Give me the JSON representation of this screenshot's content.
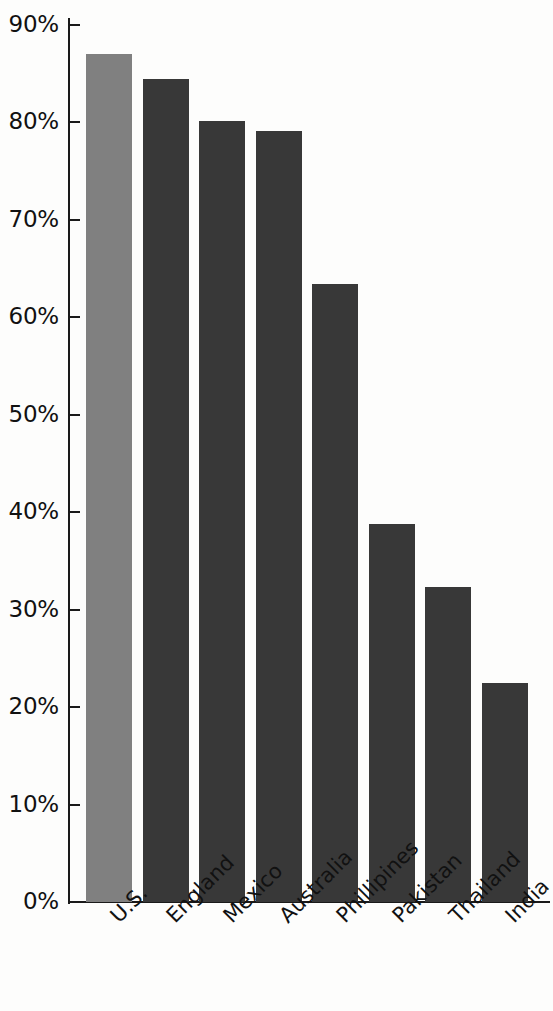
{
  "chart_data": {
    "type": "bar",
    "title": "",
    "subtitle": "",
    "xlabel": "",
    "ylabel": "",
    "categories": [
      "U.S.",
      "England",
      "Mexico",
      "Australia",
      "Phillipines",
      "Pakistan",
      "Thailand",
      "India"
    ],
    "values": [
      87.0,
      84.5,
      80.2,
      79.1,
      63.4,
      38.8,
      32.3,
      22.5
    ],
    "value_labels": [
      "87%",
      "84.5%",
      "80.2%",
      "79.1%",
      "63.4%",
      "38.8%",
      "32.3%",
      "22.5%"
    ],
    "ylim": [
      0,
      90
    ],
    "ytick_values": [
      0,
      10,
      20,
      30,
      40,
      50,
      60,
      70,
      80,
      90
    ],
    "ytick_labels": [
      "0%",
      "10%",
      "20%",
      "30%",
      "40%",
      "50%",
      "60%",
      "70%",
      "80%",
      "90%"
    ],
    "grid": false,
    "legend": null,
    "legend_position": "none",
    "bar_colors": [
      "#808080",
      "#383838",
      "#383838",
      "#383838",
      "#383838",
      "#383838",
      "#383838",
      "#383838"
    ],
    "highlight_index": 0,
    "axis_color": "#1a1a1a",
    "background_color": "#fdfdfc",
    "text_color": "#111111",
    "annotations": []
  }
}
